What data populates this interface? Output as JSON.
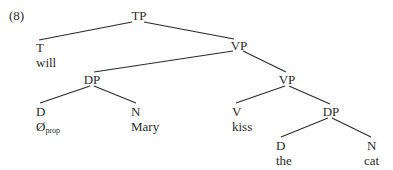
{
  "example_number": "(8)",
  "tree": {
    "TP": {
      "label": "TP"
    },
    "T": {
      "label": "T",
      "word": "will"
    },
    "VP_upper": {
      "label": "VP"
    },
    "DP_subject": {
      "label": "DP"
    },
    "D_subject": {
      "label": "D",
      "word": "Ø",
      "word_subscript": "prop"
    },
    "N_subject": {
      "label": "N",
      "word": "Mary"
    },
    "VP_lower": {
      "label": "VP"
    },
    "V": {
      "label": "V",
      "word": "kiss"
    },
    "DP_object": {
      "label": "DP"
    },
    "D_object": {
      "label": "D",
      "word": "the"
    },
    "N_object": {
      "label": "N",
      "word": "cat"
    }
  },
  "colors": {
    "ink": "#2a2a2a",
    "background": "#ffffff"
  }
}
